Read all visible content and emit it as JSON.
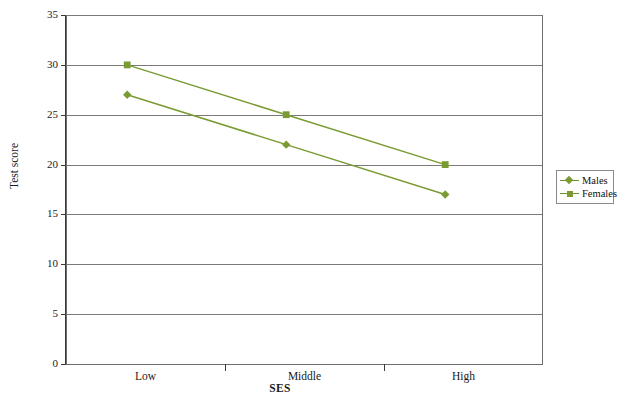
{
  "figure": {
    "top_caption_faint": "",
    "credit": "© Cengage Learning"
  },
  "chart_data": {
    "type": "line",
    "title": "",
    "xlabel": "SES",
    "ylabel": "Test score",
    "categories": [
      "Low",
      "Middle",
      "High"
    ],
    "series": [
      {
        "name": "Males",
        "values": [
          27,
          22,
          17
        ],
        "marker": "diamond",
        "color": "#7a9b32"
      },
      {
        "name": "Females",
        "values": [
          30,
          25,
          20
        ],
        "marker": "square",
        "color": "#7a9b32"
      }
    ],
    "ylim": [
      0,
      35
    ],
    "ytick_labels": [
      "0",
      "5",
      "10",
      "15",
      "20",
      "25",
      "30",
      "35"
    ],
    "ytick_values": [
      0,
      5,
      10,
      15,
      20,
      25,
      30,
      35
    ],
    "grid": "horizontal",
    "legend_position": "right"
  },
  "legend": {
    "entries": [
      {
        "label": "Males",
        "marker": "diamond"
      },
      {
        "label": "Females",
        "marker": "square"
      }
    ]
  }
}
